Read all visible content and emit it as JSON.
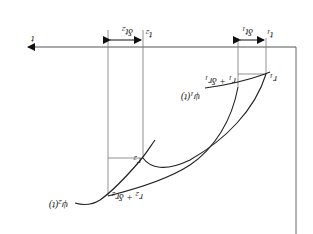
{
  "diagram": {
    "orientation": "rotated-180",
    "axis": {
      "label": "t"
    },
    "intervals": [
      {
        "start_label": "t",
        "start_sub": "1",
        "width_label": "δt",
        "width_sub": "1"
      },
      {
        "start_label": "t",
        "start_sub": "2",
        "width_label": "δt",
        "width_sub": "2"
      }
    ],
    "points": [
      {
        "name": "r1",
        "label": "r",
        "sub": "1"
      },
      {
        "name": "r1-plus-dr1",
        "label": "r",
        "sub": "1",
        "suffix": " + δr",
        "suffix_sub": "1"
      },
      {
        "name": "r2",
        "label": "r",
        "sub": "2"
      },
      {
        "name": "r2-plus-dr2",
        "label": "r",
        "sub": "2",
        "suffix": " + δr",
        "suffix_sub": "2"
      }
    ],
    "curves": [
      {
        "name": "psi1",
        "label": "ψ",
        "sub": "1",
        "arg": "(t)"
      },
      {
        "name": "psi2",
        "label": "ψ",
        "sub": "2",
        "arg": "(t)"
      }
    ]
  }
}
